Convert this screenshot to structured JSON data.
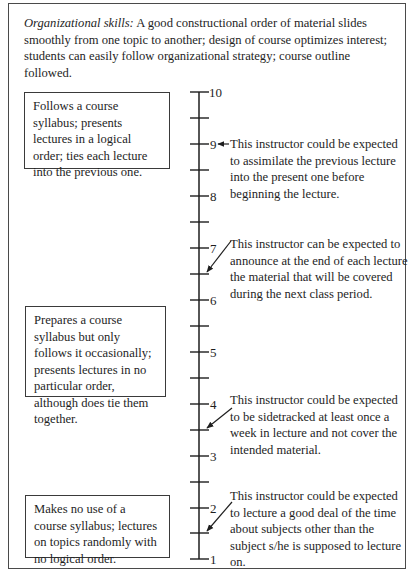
{
  "header": {
    "title_italic": "Organizational skills:",
    "description": " A good constructional order of material slides smoothly from one topic to another; design of course optimizes interest; students can easily follow organizational strategy; course outline followed."
  },
  "scale": {
    "min": 1,
    "max": 10,
    "labels": [
      "10",
      "9",
      "8",
      "7",
      "6",
      "5",
      "4",
      "3",
      "2",
      "1"
    ],
    "line_color": "#1e1e1e"
  },
  "anchors": [
    {
      "level": "high",
      "text": "Follows a course syllabus; presents lectures in a logical order; ties each lecture into the previous one."
    },
    {
      "level": "mid",
      "text": "Prepares a course syllabus but only follows it occasionally; presents lectures in no particular order, although does tie them together."
    },
    {
      "level": "low",
      "text": "Makes no use of a course syllabus; lectures on topics randomly with no logical order."
    }
  ],
  "behavioral_examples": [
    {
      "value": 9,
      "text": "This instructor could be expected to assimilate the previous lecture into the present one before beginning the lecture."
    },
    {
      "value": 6.5,
      "text": "This instructor can be expected to announce at the end of each lecture the material that will be covered during the next class period."
    },
    {
      "value": 3.5,
      "text": "This instructor could be expected to be sidetracked at least once a week in lecture and not cover the intended material."
    },
    {
      "value": 1.5,
      "text": "This instructor could be expected to lecture a good deal of the time about subjects other than the subject s/he is supposed to lecture on."
    }
  ]
}
